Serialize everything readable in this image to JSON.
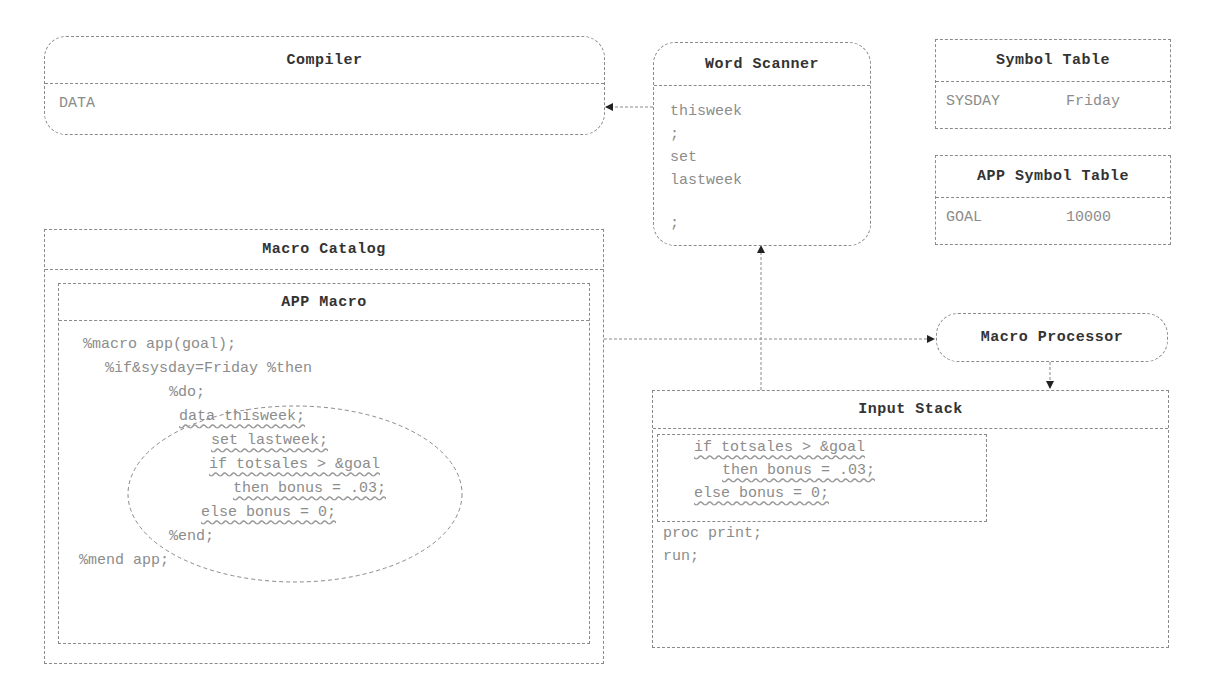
{
  "compiler": {
    "title": "Compiler",
    "content": "DATA"
  },
  "word_scanner": {
    "title": "Word Scanner",
    "tokens": [
      "thisweek",
      ";",
      "set",
      "lastweek",
      ";"
    ]
  },
  "symbol_table": {
    "title": "Symbol Table",
    "name": "SYSDAY",
    "value": "Friday"
  },
  "app_symbol_table": {
    "title": "APP Symbol Table",
    "name": "GOAL",
    "value": "10000"
  },
  "macro_catalog": {
    "title": "Macro Catalog",
    "app_macro": {
      "title": "APP Macro",
      "lines": [
        "%macro app(goal);",
        "%if&sysday=Friday %then",
        "%do;",
        "data thisweek;",
        "set lastweek;",
        "if totsales > &goal",
        "then bonus = .03;",
        "else bonus = 0;",
        "%end;",
        "%mend app;"
      ]
    }
  },
  "macro_processor": {
    "title": "Macro Processor"
  },
  "input_stack": {
    "title": "Input Stack",
    "stacked_lines": [
      "if totsales > &goal",
      "then bonus = .03;",
      "else bonus = 0;"
    ],
    "lines": [
      "proc print;",
      "run;"
    ]
  },
  "colors": {
    "line": "#8a8a8a",
    "header_text": "#333333",
    "body_text": "#8c8c8c"
  }
}
